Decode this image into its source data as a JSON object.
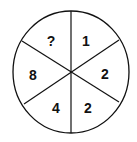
{
  "puzzle": {
    "type": "number-wheel",
    "segments": [
      {
        "position": "top-left",
        "value": "?"
      },
      {
        "position": "top-right",
        "value": "1"
      },
      {
        "position": "right",
        "value": "2"
      },
      {
        "position": "bottom-right",
        "value": "2"
      },
      {
        "position": "bottom-left",
        "value": "4"
      },
      {
        "position": "left",
        "value": "8"
      }
    ]
  }
}
